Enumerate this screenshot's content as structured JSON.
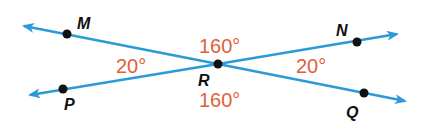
{
  "diagram": {
    "type": "intersecting-lines-angles",
    "colors": {
      "line": "#2b9ad9",
      "angle_text": "#e0603a",
      "point": "#111111",
      "label": "#111111"
    },
    "intersection": {
      "label": "R"
    },
    "points": [
      {
        "id": "M",
        "label": "M"
      },
      {
        "id": "N",
        "label": "N"
      },
      {
        "id": "P",
        "label": "P"
      },
      {
        "id": "Q",
        "label": "Q"
      },
      {
        "id": "R",
        "label": "R"
      }
    ],
    "lines": [
      {
        "name": "MQ",
        "through": [
          "M",
          "R",
          "Q"
        ]
      },
      {
        "name": "PN",
        "through": [
          "P",
          "R",
          "N"
        ]
      }
    ],
    "angles": [
      {
        "name": "angle-MRP",
        "position": "left",
        "value": "20°"
      },
      {
        "name": "angle-MRN",
        "position": "top",
        "value": "160°"
      },
      {
        "name": "angle-NRQ",
        "position": "right",
        "value": "20°"
      },
      {
        "name": "angle-PRQ",
        "position": "bottom",
        "value": "160°"
      }
    ]
  }
}
